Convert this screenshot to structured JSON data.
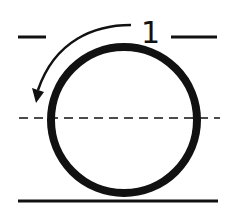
{
  "diagram": {
    "label": "1",
    "colors": {
      "stroke": "#111111",
      "background": "#ffffff"
    },
    "elements": [
      "circle",
      "top-line-left",
      "top-line-right",
      "dashed-center-line",
      "base-line",
      "curved-arrow"
    ]
  }
}
